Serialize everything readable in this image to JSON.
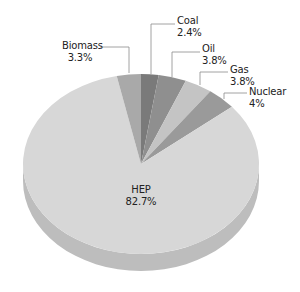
{
  "chart_data": {
    "type": "pie",
    "style": "3d",
    "title": "",
    "start_angle_deg": 0,
    "direction": "clockwise",
    "slices": [
      {
        "label": "Coal",
        "value": 2.4,
        "display": "2.4%",
        "color": "#7a7a7a"
      },
      {
        "label": "Oil",
        "value": 3.8,
        "display": "3.8%",
        "color": "#8f8f8f"
      },
      {
        "label": "Gas",
        "value": 3.8,
        "display": "3.8%",
        "color": "#c4c4c4"
      },
      {
        "label": "Nuclear",
        "value": 4,
        "display": "4%",
        "color": "#9a9a9a"
      },
      {
        "label": "HEP",
        "value": 82.7,
        "display": "82.7%",
        "color": "#d7d7d7"
      },
      {
        "label": "Biomass",
        "value": 3.3,
        "display": "3.3%",
        "color": "#a9a9a9"
      }
    ],
    "legend": "none",
    "labels": "callout"
  },
  "labels": {
    "coal": {
      "name": "Coal",
      "pct": "2.4%"
    },
    "oil": {
      "name": "Oil",
      "pct": "3.8%"
    },
    "gas": {
      "name": "Gas",
      "pct": "3.8%"
    },
    "nuclear": {
      "name": "Nuclear",
      "pct": "4%"
    },
    "biomass": {
      "name": "Biomass",
      "pct": "3.3%"
    },
    "hep": {
      "name": "HEP",
      "pct": "82.7%"
    }
  },
  "colors": {
    "side": "#bdbdbd",
    "side_shadow": "#b2b2b2",
    "leader": "#8a8a8a"
  }
}
